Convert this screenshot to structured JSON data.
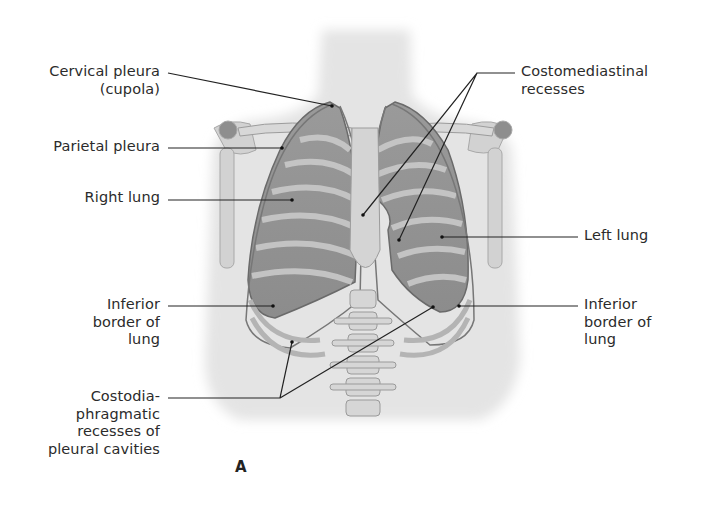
{
  "figure": {
    "panel_letter": "A",
    "colors": {
      "lung_fill": "#8a8a8a",
      "rib_light": "#cfcfcf",
      "body_shade": "#e6e6e6",
      "outline": "#6e6e6e",
      "leader_line": "#222222",
      "text": "#2b2b2b"
    }
  },
  "labels": {
    "cervical_pleura": {
      "line1": "Cervical pleura",
      "line2": "(cupola)"
    },
    "parietal_pleura": {
      "line1": "Parietal pleura"
    },
    "right_lung": {
      "line1": "Right lung"
    },
    "inferior_border_right": {
      "line1": "Inferior",
      "line2": "border of",
      "line3": "lung"
    },
    "costodiaphragmatic": {
      "line1": "Costodia-",
      "line2": "phragmatic",
      "line3": "recesses of",
      "line4": "pleural cavities"
    },
    "costomediastinal": {
      "line1": "Costomediastinal",
      "line2": "recesses"
    },
    "left_lung": {
      "line1": "Left lung"
    },
    "inferior_border_left": {
      "line1": "Inferior",
      "line2": "border of",
      "line3": "lung"
    }
  }
}
